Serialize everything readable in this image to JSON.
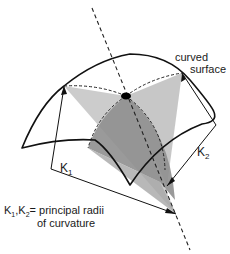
{
  "diagram": {
    "labels": {
      "surface_line1": "curved",
      "surface_line2": "surface",
      "k1": "K",
      "k1_sub": "1",
      "k2": "K",
      "k2_sub": "2",
      "legend_k1": "K",
      "legend_k1_sub": "1",
      "legend_sep": ",",
      "legend_k2": "K",
      "legend_k2_sub": "2",
      "legend_rest": "= principal radii",
      "legend_line2": "of curvature"
    },
    "colors": {
      "stroke": "#111111",
      "light_fill": "#c9c9c9",
      "mid_fill": "#a8a8a8",
      "dark_fill": "#8a8a8a",
      "background": "#ffffff"
    }
  }
}
